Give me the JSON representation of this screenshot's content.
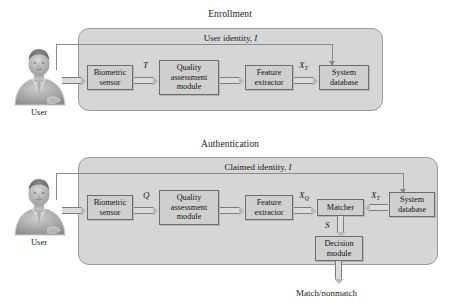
{
  "figure": {
    "colors": {
      "panel_fill": "#d6d6d6",
      "panel_stroke": "#9a9a9a",
      "box_fill": "#cfcfcf",
      "box_stroke": "#6d6d6d",
      "arrow_fill": "#dcdcdc",
      "arrow_stroke": "#7b7b7b",
      "text": "#1a1a1a",
      "background": "#ffffff"
    }
  },
  "enrollment": {
    "section_title": "Enrollment",
    "identity_label": "User identity,",
    "identity_symbol": "I",
    "user_caption": "User",
    "boxes": [
      {
        "id": "biometric-sensor",
        "lines": [
          "Biometric",
          "sensor"
        ]
      },
      {
        "id": "quality-assessment-module",
        "lines": [
          "Quality",
          "assessment",
          "module"
        ]
      },
      {
        "id": "feature-extractor",
        "lines": [
          "Feature",
          "extractor"
        ]
      },
      {
        "id": "system-database",
        "lines": [
          "System",
          "database"
        ]
      }
    ],
    "signals": [
      {
        "id": "signal-T",
        "base": "T",
        "sub": ""
      },
      {
        "id": "signal-XT",
        "base": "X",
        "sub": "T"
      }
    ]
  },
  "authentication": {
    "section_title": "Authentication",
    "identity_label": "Claimed identity,",
    "identity_symbol": "I",
    "user_caption": "User",
    "boxes": [
      {
        "id": "biometric-sensor",
        "lines": [
          "Biometric",
          "sensor"
        ]
      },
      {
        "id": "quality-assessment-module",
        "lines": [
          "Quality",
          "assessment",
          "module"
        ]
      },
      {
        "id": "feature-extractor",
        "lines": [
          "Feature",
          "extractor"
        ]
      },
      {
        "id": "matcher",
        "lines": [
          "Matcher"
        ]
      },
      {
        "id": "system-database",
        "lines": [
          "System",
          "database"
        ]
      },
      {
        "id": "decision-module",
        "lines": [
          "Decision",
          "module"
        ]
      }
    ],
    "signals": [
      {
        "id": "signal-Q",
        "base": "Q",
        "sub": ""
      },
      {
        "id": "signal-XQ",
        "base": "X",
        "sub": "Q"
      },
      {
        "id": "signal-XT",
        "base": "X",
        "sub": "T"
      },
      {
        "id": "signal-S",
        "base": "S",
        "sub": ""
      }
    ],
    "output_label": "Match/nonmatch"
  }
}
